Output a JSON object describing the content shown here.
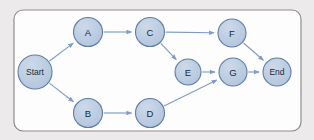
{
  "page": {
    "background_color": "#eceaea"
  },
  "container": {
    "name": "diagram-frame",
    "x": 14,
    "y": 10,
    "width": 287,
    "height": 121,
    "radius": 9,
    "fill": "#fdfdfd",
    "stroke": "#8e8e8e"
  },
  "diagram": {
    "type": "directed-graph",
    "node_fill": "#b9cade",
    "node_stroke": "#5f7da4",
    "edge_color": "#7f9dc4",
    "label_color": "#1b2838",
    "nodes": [
      {
        "id": "start",
        "label": "Start",
        "cx": 35,
        "cy": 72,
        "r": 17,
        "font_size": 8.5
      },
      {
        "id": "a",
        "label": "A",
        "cx": 88,
        "cy": 32,
        "r": 14.5,
        "font_size": 9.5
      },
      {
        "id": "b",
        "label": "B",
        "cx": 88,
        "cy": 113,
        "r": 14.5,
        "font_size": 9.5
      },
      {
        "id": "c",
        "label": "C",
        "cx": 150,
        "cy": 32,
        "r": 14.5,
        "font_size": 9.5
      },
      {
        "id": "d",
        "label": "D",
        "cx": 150,
        "cy": 113,
        "r": 14.5,
        "font_size": 9.5
      },
      {
        "id": "e",
        "label": "E",
        "cx": 188,
        "cy": 72,
        "r": 13,
        "font_size": 9.5
      },
      {
        "id": "f",
        "label": "F",
        "cx": 232,
        "cy": 33,
        "r": 14,
        "font_size": 9.5
      },
      {
        "id": "g",
        "label": "G",
        "cx": 233,
        "cy": 72,
        "r": 14,
        "font_size": 9.5
      },
      {
        "id": "end",
        "label": "End",
        "cx": 277,
        "cy": 72,
        "r": 14,
        "font_size": 8.5
      }
    ],
    "edges": [
      {
        "id": "start-a",
        "from": "start",
        "to": "a"
      },
      {
        "id": "start-b",
        "from": "start",
        "to": "b"
      },
      {
        "id": "a-c",
        "from": "a",
        "to": "c"
      },
      {
        "id": "c-f",
        "from": "c",
        "to": "f"
      },
      {
        "id": "c-e",
        "from": "c",
        "to": "e"
      },
      {
        "id": "b-d",
        "from": "b",
        "to": "d"
      },
      {
        "id": "d-g",
        "from": "d",
        "to": "g"
      },
      {
        "id": "e-g",
        "from": "e",
        "to": "g"
      },
      {
        "id": "f-end",
        "from": "f",
        "to": "end"
      },
      {
        "id": "g-end",
        "from": "g",
        "to": "end"
      }
    ]
  }
}
